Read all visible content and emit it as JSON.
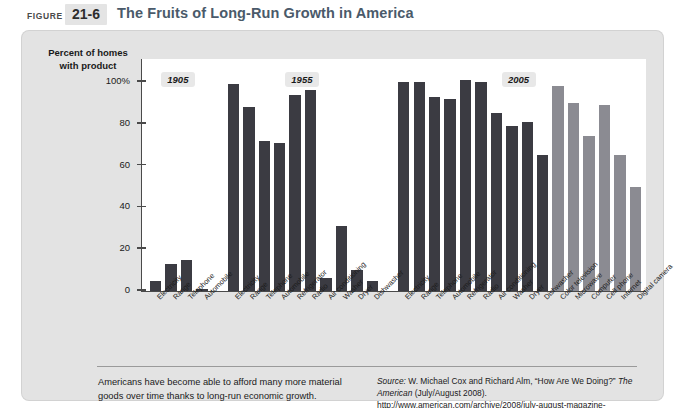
{
  "header": {
    "figure_word": "FIGURE",
    "figure_number": "21-6",
    "title": "The Fruits of Long-Run Growth in America"
  },
  "footer": {
    "caption": "Americans have become able to afford many more material goods over time thanks to long-run economic growth.",
    "source_prefix": "Source:",
    "source_authors": " W. Michael Cox and Richard Alm, “How Are We Doing?” ",
    "source_pub": "The American",
    "source_rest": " (July/August 2008). http://www.american.com/archive/2008/july-august-magazine-contents/how-are-we-doing"
  },
  "colors": {
    "bar_dark": "#3b3b42",
    "bar_light": "#8b8b92",
    "panel_bg": "#e3e3e3",
    "plot_bg": "#ffffff",
    "axis": "#4a4a4a",
    "title": "#4a5a6a"
  },
  "chart_data": {
    "type": "bar",
    "title": "The Fruits of Long-Run Growth in America",
    "ylabel": "Percent of homes with product",
    "xlabel": "",
    "ylim": [
      0,
      100
    ],
    "yticks": [
      0,
      20,
      40,
      60,
      80,
      100
    ],
    "ytick_labels": [
      "0",
      "20",
      "40",
      "60",
      "80",
      "100%"
    ],
    "grid": false,
    "legend": "none",
    "groups": [
      {
        "name": "1905",
        "categories": [
          "Electricity",
          "Range",
          "Telephone",
          "Automobile"
        ],
        "values": [
          5,
          13,
          15,
          1
        ],
        "shades": [
          "dark",
          "dark",
          "dark",
          "dark"
        ]
      },
      {
        "name": "1955",
        "categories": [
          "Electricity",
          "Range",
          "Telephone",
          "Automobile",
          "Refrigerator",
          "Radio",
          "Air conditioning",
          "Washer",
          "Dryer",
          "Dishwasher"
        ],
        "values": [
          99,
          88,
          72,
          71,
          94,
          96,
          6,
          31,
          10,
          5
        ],
        "shades": [
          "dark",
          "dark",
          "dark",
          "dark",
          "dark",
          "dark",
          "dark",
          "dark",
          "dark",
          "dark"
        ]
      },
      {
        "name": "2005",
        "categories": [
          "Electricity",
          "Range",
          "Telephone",
          "Automobile",
          "Refrigerator",
          "Radio",
          "Air conditioning",
          "Washer",
          "Dryer",
          "Dishwasher",
          "Color television",
          "Microwave",
          "Computer",
          "Cell phone",
          "Internet",
          "Digital camera"
        ],
        "values": [
          100,
          100,
          93,
          92,
          101,
          100,
          85,
          79,
          81,
          65,
          98,
          90,
          74,
          89,
          65,
          50
        ],
        "shades": [
          "dark",
          "dark",
          "dark",
          "dark",
          "dark",
          "dark",
          "dark",
          "dark",
          "dark",
          "dark",
          "light",
          "light",
          "light",
          "light",
          "light",
          "light"
        ]
      }
    ]
  }
}
